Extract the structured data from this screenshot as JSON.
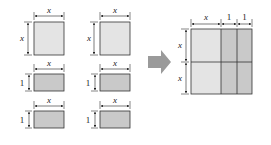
{
  "diagram": {
    "type": "algebra-tiles",
    "colors": {
      "square_fill": "#e4e4e4",
      "rect_fill": "#c9c9c9",
      "stroke": "#333333",
      "arrow": "#9a9a9a"
    },
    "left_tiles": [
      {
        "kind": "square",
        "width_label": "x",
        "height_label": "x"
      },
      {
        "kind": "square",
        "width_label": "x",
        "height_label": "x"
      },
      {
        "kind": "rect",
        "width_label": "x",
        "height_label": "1"
      },
      {
        "kind": "rect",
        "width_label": "x",
        "height_label": "1"
      },
      {
        "kind": "rect",
        "width_label": "x",
        "height_label": "1"
      },
      {
        "kind": "rect",
        "width_label": "x",
        "height_label": "1"
      }
    ],
    "result": {
      "top_labels": [
        "x",
        "1",
        "1"
      ],
      "side_labels": [
        "x",
        "x"
      ]
    }
  }
}
